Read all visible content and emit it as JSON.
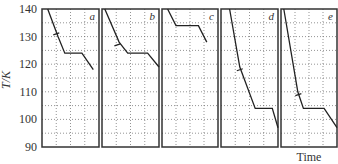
{
  "chart_data": {
    "type": "line",
    "title": "",
    "xlabel": "Time",
    "ylabel": "T/K",
    "ylim": [
      90,
      140
    ],
    "yticks": [
      90,
      100,
      110,
      120,
      130,
      140
    ],
    "grid": true,
    "panels": [
      {
        "label": "a",
        "points": [
          [
            0.1,
            140
          ],
          [
            0.28,
            130
          ],
          [
            0.4,
            124
          ],
          [
            0.7,
            124
          ],
          [
            0.9,
            118
          ]
        ],
        "mark": [
          0.25,
          131
        ]
      },
      {
        "label": "b",
        "points": [
          [
            0.05,
            140
          ],
          [
            0.3,
            128
          ],
          [
            0.45,
            124
          ],
          [
            0.8,
            124
          ],
          [
            1.0,
            119
          ]
        ],
        "mark": [
          0.27,
          127
        ]
      },
      {
        "label": "c",
        "points": [
          [
            0.1,
            140
          ],
          [
            0.25,
            134
          ],
          [
            0.65,
            134
          ],
          [
            0.8,
            128
          ]
        ]
      },
      {
        "label": "d",
        "points": [
          [
            0.15,
            140
          ],
          [
            0.33,
            119
          ],
          [
            0.6,
            104
          ],
          [
            0.9,
            104
          ],
          [
            1.0,
            97
          ]
        ],
        "mark": [
          0.33,
          118
        ]
      },
      {
        "label": "e",
        "points": [
          [
            0.05,
            140
          ],
          [
            0.3,
            110
          ],
          [
            0.4,
            104
          ],
          [
            0.77,
            104
          ],
          [
            1.0,
            97
          ]
        ],
        "mark": [
          0.31,
          109
        ]
      }
    ]
  }
}
